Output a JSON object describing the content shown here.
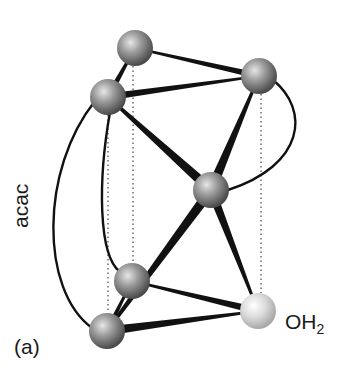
{
  "figure": {
    "panel_label": "(a)",
    "ligand_label": "acac",
    "water_label": {
      "main": "OH",
      "subscript": "2"
    },
    "colors": {
      "background": "#ffffff",
      "bond": "#111111",
      "atom_dark": "#8a8a8a",
      "atom_light": "#d9d9d9",
      "dotted_line": "#555555",
      "text": "#1a1a1a"
    },
    "atoms": [
      {
        "id": "A",
        "role": "ligand-atom-top-back",
        "cx": 135,
        "cy": 48,
        "r": 18,
        "shade": "dark"
      },
      {
        "id": "B",
        "role": "ligand-atom-upper-left",
        "cx": 108,
        "cy": 97,
        "r": 18,
        "shade": "dark"
      },
      {
        "id": "C",
        "role": "ligand-atom-upper-right",
        "cx": 259,
        "cy": 76,
        "r": 18,
        "shade": "dark"
      },
      {
        "id": "D",
        "role": "central-metal",
        "cx": 211,
        "cy": 190,
        "r": 18,
        "shade": "dark"
      },
      {
        "id": "E",
        "role": "ligand-atom-lower-back",
        "cx": 132,
        "cy": 281,
        "r": 18,
        "shade": "dark"
      },
      {
        "id": "F",
        "role": "ligand-atom-lower-front",
        "cx": 107,
        "cy": 331,
        "r": 18,
        "shade": "dark"
      },
      {
        "id": "G",
        "role": "water-oxygen",
        "cx": 258,
        "cy": 311,
        "r": 18,
        "shade": "light"
      }
    ],
    "bonds": [
      {
        "from": "A",
        "to": "C",
        "w1": 2,
        "w2": 6
      },
      {
        "from": "B",
        "to": "C",
        "w1": 7,
        "w2": 2
      },
      {
        "from": "A",
        "to": "B",
        "w1": 2,
        "w2": 6
      },
      {
        "from": "B",
        "to": "D",
        "w1": 3,
        "w2": 10
      },
      {
        "from": "C",
        "to": "D",
        "w1": 2,
        "w2": 10
      },
      {
        "from": "D",
        "to": "F",
        "w1": 10,
        "w2": 3
      },
      {
        "from": "D",
        "to": "G",
        "w1": 9,
        "w2": 2
      },
      {
        "from": "E",
        "to": "G",
        "w1": 2,
        "w2": 7
      },
      {
        "from": "F",
        "to": "G",
        "w1": 9,
        "w2": 2
      },
      {
        "from": "E",
        "to": "F",
        "w1": 2,
        "w2": 5
      }
    ],
    "arcs": [
      {
        "name": "acac-arc-outer",
        "d": "M 95 101 C 40 170, 40 290, 92 328"
      },
      {
        "name": "acac-arc-inner",
        "d": "M 110 112 C 98 180, 98 255, 120 272"
      },
      {
        "name": "chelate-arc-right",
        "d": "M 273 80 C 310 110, 305 165, 228 190"
      }
    ],
    "dotted_lines": [
      {
        "x1": 133,
        "y1": 66,
        "x2": 133,
        "y2": 263
      },
      {
        "x1": 108,
        "y1": 115,
        "x2": 108,
        "y2": 313
      },
      {
        "x1": 261,
        "y1": 94,
        "x2": 261,
        "y2": 293
      }
    ]
  }
}
